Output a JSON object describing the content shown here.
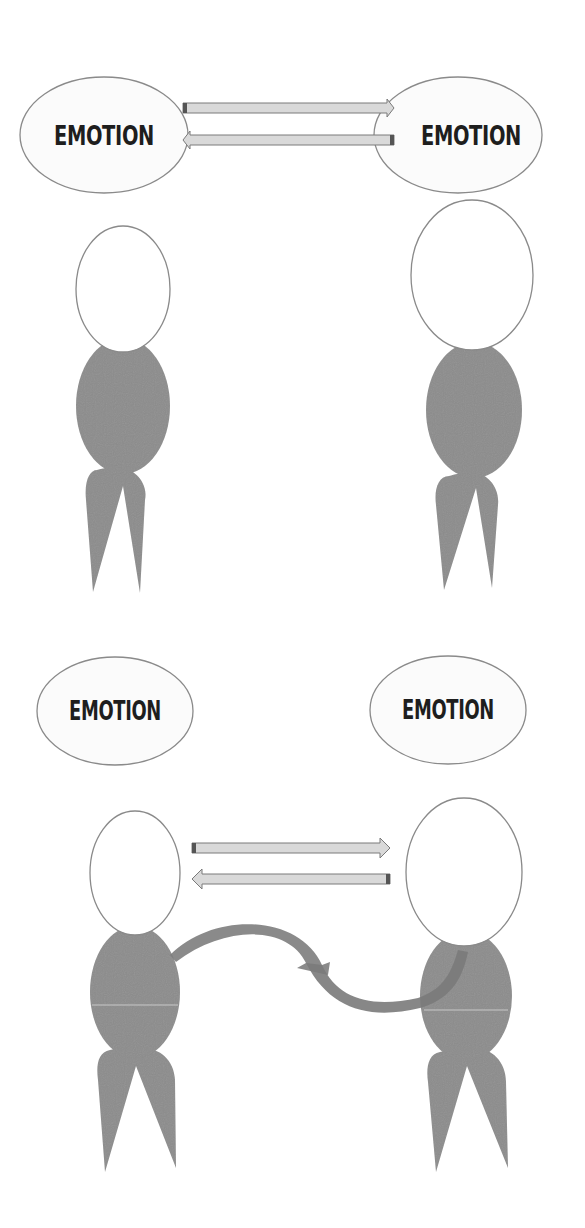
{
  "diagram": {
    "top_panel": {
      "left_bubble": {
        "label": "EMOTION"
      },
      "right_bubble": {
        "label": "EMOTION"
      },
      "arrows": [
        "left-to-right",
        "right-to-left"
      ]
    },
    "bottom_panel": {
      "left_bubble": {
        "label": "EMOTION"
      },
      "right_bubble": {
        "label": "EMOTION"
      },
      "arrows": [
        "left-to-right",
        "right-to-left"
      ],
      "curved_arrow": "body-to-body"
    },
    "colors": {
      "body_fill": "#8c8c8c",
      "outline": "#8a8a8a",
      "arrow_fill": "#d9d9d9",
      "arrow_stroke": "#7a7a7a",
      "text": "#1e1e1e"
    }
  }
}
